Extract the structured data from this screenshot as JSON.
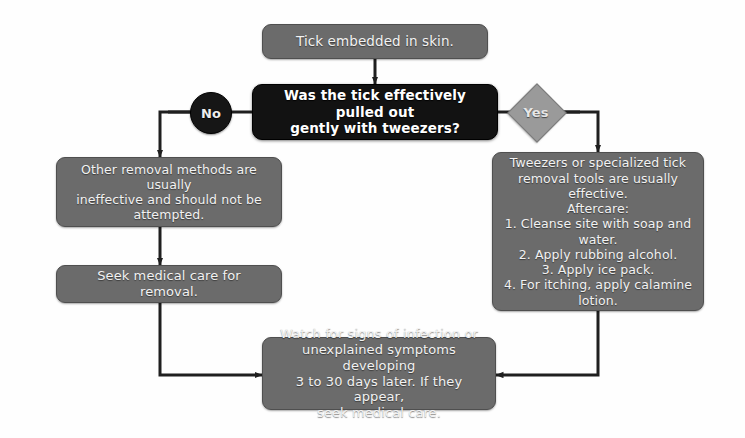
{
  "diagram": {
    "colors": {
      "background": "#fefefe",
      "process_fill": "#6b6b6b",
      "process_border": "#4f4f4f",
      "decision_fill": "#121212",
      "badge_no_fill": "#161616",
      "badge_yes_fill": "#9a9a9a",
      "edge": "#1f1f1f",
      "text": "#f2f2f2"
    },
    "nodes": [
      {
        "id": "start",
        "kind": "process",
        "text": "Tick embedded in skin."
      },
      {
        "id": "decision",
        "kind": "decision",
        "text": "Was the tick effectively pulled out\ngently with tweezers?"
      },
      {
        "id": "no_branch",
        "kind": "process",
        "text": "Other removal methods are usually\nineffective and should not be\nattempted."
      },
      {
        "id": "seek_care",
        "kind": "process",
        "text": "Seek medical care for removal."
      },
      {
        "id": "yes_branch",
        "kind": "process",
        "text": "Tweezers or specialized tick\nremoval tools are usually effective.\nAftercare:\n1. Cleanse site with soap and water.\n2. Apply rubbing alcohol.\n3. Apply ice pack.\n4. For itching, apply calamine\nlotion."
      },
      {
        "id": "watch",
        "kind": "process",
        "text": "Watch for signs of infection or\nunexplained symptoms developing\n3 to 30 days later. If they appear,\nseek medical care."
      }
    ],
    "branch_labels": {
      "no": "No",
      "yes": "Yes"
    }
  }
}
